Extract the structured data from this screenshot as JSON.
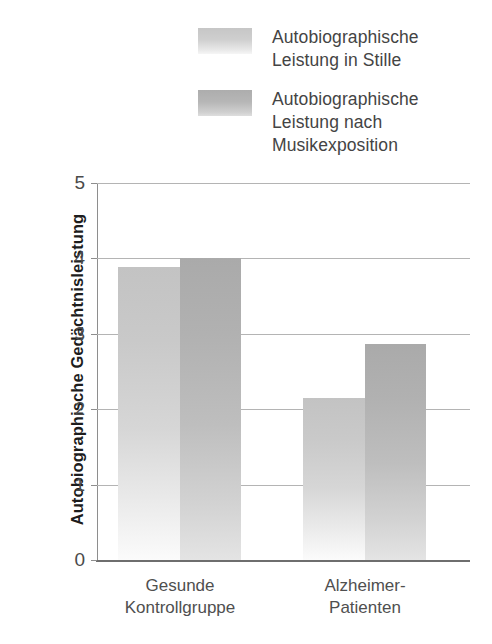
{
  "chart_data": {
    "type": "bar",
    "title": "",
    "xlabel": "",
    "ylabel": "Autobiographische Gedächtnisleistung",
    "ylim": [
      0,
      5
    ],
    "yticks": [
      "0",
      "1",
      "2",
      "3",
      "4",
      "5"
    ],
    "grid": true,
    "legend_position": "top",
    "categories": [
      "Gesunde\nKontrollgruppe",
      "Alzheimer-\nPatienten"
    ],
    "series": [
      {
        "name": "Autobiographische Leistung in Stille",
        "color": "#c9c9c9",
        "values": [
          3.88,
          2.15
        ]
      },
      {
        "name": "Autobiographische Leistung nach Musikexposition",
        "color": "#b0b0b0",
        "values": [
          4.0,
          2.87
        ]
      }
    ]
  },
  "legend": {
    "items": [
      {
        "label": "Autobiographische\nLeistung in Stille"
      },
      {
        "label": "Autobiographische\nLeistung nach\nMusikexposition"
      }
    ]
  }
}
